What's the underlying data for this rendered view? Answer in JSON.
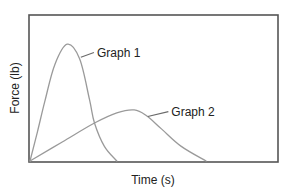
{
  "chart_data": {
    "type": "line",
    "title": "",
    "xlabel": "Time (s)",
    "ylabel": "Force (lb)",
    "xlim": [
      0,
      10
    ],
    "ylim": [
      0,
      10
    ],
    "grid": false,
    "ticks": false,
    "legend": "inline-annotations",
    "series": [
      {
        "name": "Graph 1",
        "x": [
          0,
          0.3,
          0.6,
          1.0,
          1.5,
          2.0,
          2.4,
          2.6,
          3.0,
          3.5
        ],
        "y": [
          0,
          2.0,
          4.1,
          6.6,
          8.0,
          7.0,
          4.2,
          2.6,
          1.0,
          0
        ],
        "annotation": {
          "text": "Graph 1",
          "anchor_x": 2.05,
          "anchor_y": 7.1,
          "label_x": 2.7,
          "label_y": 7.5
        }
      },
      {
        "name": "Graph 2",
        "x": [
          0,
          1.3,
          2.6,
          3.5,
          4.2,
          4.7,
          5.3,
          6.1,
          7.1
        ],
        "y": [
          0,
          1.3,
          2.6,
          3.3,
          3.5,
          3.1,
          2.2,
          1.0,
          0
        ],
        "annotation": {
          "text": "Graph 2",
          "anchor_x": 4.75,
          "anchor_y": 3.05,
          "label_x": 5.7,
          "label_y": 3.45
        }
      }
    ]
  },
  "colors": {
    "frame": "#555555",
    "curves": "#9a9a9a",
    "text": "#222222"
  }
}
